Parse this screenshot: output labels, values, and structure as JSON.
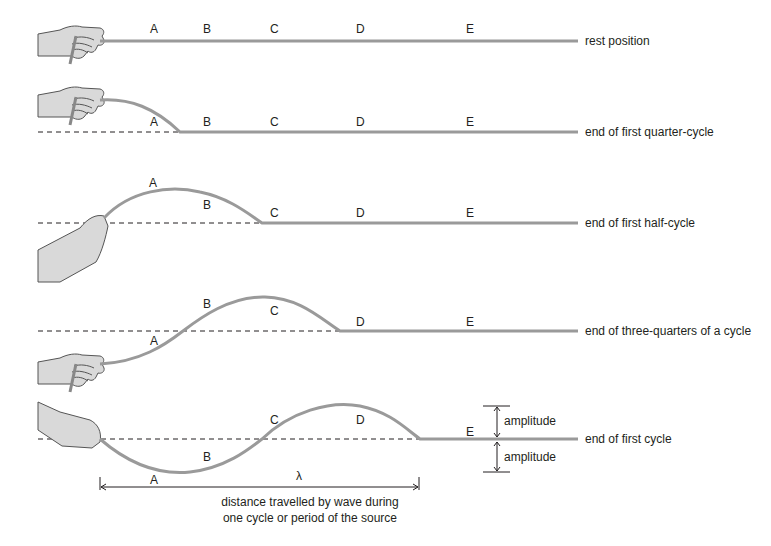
{
  "diagram": {
    "colors": {
      "rope": "#9a9a9a",
      "rope_dark": "#6d6d6d",
      "hand_fill": "#d9d9d9",
      "hand_stroke": "#555555",
      "text": "#231f20",
      "dashed_line": "#231f20"
    },
    "rows": [
      {
        "caption": "rest position",
        "points": {
          "A": "A",
          "B": "B",
          "C": "C",
          "D": "D",
          "E": "E"
        }
      },
      {
        "caption": "end of first quarter-cycle",
        "points": {
          "A": "A",
          "B": "B",
          "C": "C",
          "D": "D",
          "E": "E"
        }
      },
      {
        "caption": "end of first half-cycle",
        "points": {
          "A": "A",
          "B": "B",
          "C": "C",
          "D": "D",
          "E": "E"
        }
      },
      {
        "caption": "end of three-quarters of a cycle",
        "points": {
          "A": "A",
          "B": "B",
          "C": "C",
          "D": "D",
          "E": "E"
        }
      },
      {
        "caption": "end of first cycle",
        "points": {
          "A": "A",
          "B": "B",
          "C": "C",
          "D": "D",
          "E": "E"
        }
      }
    ],
    "amplitude_upper": "amplitude",
    "amplitude_lower": "amplitude",
    "wavelength_symbol": "λ",
    "wavelength_caption_line1": "distance travelled by wave during",
    "wavelength_caption_line2": "one cycle or period of the source"
  }
}
